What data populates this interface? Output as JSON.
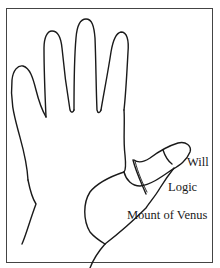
{
  "diagram": {
    "type": "hand-outline-with-labels",
    "stroke_color": "#1a1a1a",
    "frame_color": "#444444",
    "background": "#ffffff",
    "labels": {
      "will": "Will",
      "logic": "Logic",
      "mount_of_venus": "Mount of Venus"
    }
  }
}
